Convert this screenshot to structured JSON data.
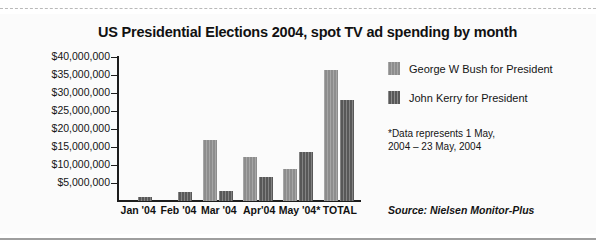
{
  "chart_data": {
    "type": "bar",
    "title": "US Presidential Elections 2004, spot TV ad spending by month",
    "xlabel": "",
    "ylabel": "",
    "categories": [
      "Jan '04",
      "Feb '04",
      "Mar '04",
      "Apr'04",
      "May '04*",
      "TOTAL"
    ],
    "series": [
      {
        "name": "George W Bush for President",
        "color": "#8d8d8d",
        "values": [
          0,
          0,
          17000000,
          12200000,
          8800000,
          36400000
        ]
      },
      {
        "name": "John Kerry for President",
        "color": "#585858",
        "values": [
          1200000,
          2400000,
          2900000,
          6600000,
          13500000,
          28000000
        ]
      }
    ],
    "ylim": [
      0,
      40000000
    ],
    "ytick_values": [
      40000000,
      35000000,
      30000000,
      25000000,
      20000000,
      15000000,
      10000000,
      5000000
    ],
    "ytick_labels": [
      "$40,000,000",
      "$35,000,000",
      "$30,000,000",
      "$25,000,000",
      "$20,000,000",
      "$15,000,000",
      "$10,000,000",
      "$5,000,000"
    ],
    "grid": false,
    "legend_position": "right",
    "annotations": [
      "*Data represents 1 May, 2004 – 23 May, 2004",
      "Source: Nielsen Monitor-Plus"
    ]
  },
  "figure": {
    "title": "US Presidential Elections 2004, spot TV ad spending by month",
    "note_line1": "*Data represents 1 May,",
    "note_line2": "2004 – 23 May, 2004",
    "source": "Source: Nielsen Monitor-Plus"
  },
  "legend": {
    "items": [
      {
        "label": "George W Bush for President"
      },
      {
        "label": "John Kerry for President"
      }
    ]
  }
}
